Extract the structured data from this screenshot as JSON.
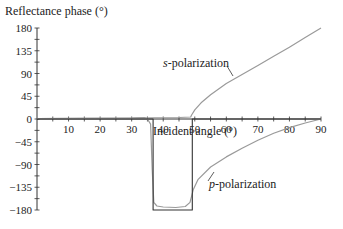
{
  "chart_data": {
    "type": "line",
    "title": "",
    "ylabel": "Reflectance phase (°)",
    "xlabel": "Incident angle (°)",
    "xlim": [
      0,
      90
    ],
    "ylim": [
      -180,
      180
    ],
    "x_ticks": [
      10,
      20,
      30,
      40,
      50,
      60,
      70,
      80,
      90
    ],
    "y_ticks": [
      180,
      135,
      90,
      45,
      0,
      -45,
      -90,
      -135,
      -180
    ],
    "grid": false,
    "legend": "none (curves annotated with leader lines)",
    "series": [
      {
        "name": "s-polarization",
        "color": "#9a9a9a",
        "points": [
          [
            0,
            1
          ],
          [
            30,
            2
          ],
          [
            45,
            3
          ],
          [
            48.7,
            4
          ],
          [
            49,
            8
          ],
          [
            50,
            18
          ],
          [
            52,
            32
          ],
          [
            55,
            48
          ],
          [
            60,
            70
          ],
          [
            65,
            88
          ],
          [
            70,
            106
          ],
          [
            75,
            124
          ],
          [
            80,
            142
          ],
          [
            85,
            161
          ],
          [
            90,
            180
          ]
        ]
      },
      {
        "name": "p-polarization",
        "color": "#9a9a9a",
        "points": [
          [
            0,
            1
          ],
          [
            30,
            2
          ],
          [
            34,
            3
          ],
          [
            35,
            0
          ],
          [
            36,
            -10
          ],
          [
            36.5,
            -100
          ],
          [
            37,
            -165
          ],
          [
            38,
            -172
          ],
          [
            40,
            -174
          ],
          [
            44,
            -175
          ],
          [
            47,
            -173
          ],
          [
            48.5,
            -165
          ],
          [
            49.5,
            -140
          ],
          [
            51,
            -120
          ],
          [
            55,
            -95
          ],
          [
            60,
            -75
          ],
          [
            65,
            -58
          ],
          [
            70,
            -42
          ],
          [
            75,
            -28
          ],
          [
            80,
            -17
          ],
          [
            85,
            -8
          ],
          [
            90,
            0
          ]
        ]
      },
      {
        "name": "p-polarization (ideal step)",
        "color": "#333333",
        "points": [
          [
            0,
            0
          ],
          [
            36.8,
            0
          ],
          [
            36.8,
            -180
          ],
          [
            49.2,
            -180
          ],
          [
            49.2,
            0
          ],
          [
            90,
            0
          ]
        ]
      }
    ],
    "annotations": [
      {
        "text_italic": "s",
        "text": "-polarization",
        "x": 56,
        "y": 80,
        "target": [
          57,
          55
        ]
      },
      {
        "text_italic": "p",
        "text": "-polarization",
        "x": 64,
        "y": -125,
        "target": [
          60,
          -108
        ]
      }
    ]
  },
  "labels": {
    "ylabel": "Reflectance phase (°)",
    "xlabel": "Incident angle (°)",
    "s_italic": "s",
    "s_rest": "-polarization",
    "p_italic": "p",
    "p_rest": "-polarization"
  }
}
